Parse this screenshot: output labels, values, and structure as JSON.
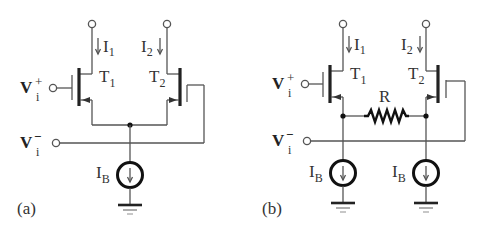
{
  "figure": {
    "panels": [
      {
        "id": "a",
        "caption": "(a)",
        "transistors": [
          {
            "name": "T",
            "sub": "1",
            "current": "I",
            "current_sub": "1"
          },
          {
            "name": "T",
            "sub": "2",
            "current": "I",
            "current_sub": "2"
          }
        ],
        "inputs": [
          {
            "label": "V",
            "sub": "i",
            "sup": "+"
          },
          {
            "label": "V",
            "sub": "i",
            "sup": "−"
          }
        ],
        "sources": [
          {
            "label": "I",
            "sub": "B"
          }
        ]
      },
      {
        "id": "b",
        "caption": "(b)",
        "transistors": [
          {
            "name": "T",
            "sub": "1",
            "current": "I",
            "current_sub": "1"
          },
          {
            "name": "T",
            "sub": "2",
            "current": "I",
            "current_sub": "2"
          }
        ],
        "inputs": [
          {
            "label": "V",
            "sub": "i",
            "sup": "+"
          },
          {
            "label": "V",
            "sub": "i",
            "sup": "−"
          }
        ],
        "resistor": {
          "label": "R"
        },
        "sources": [
          {
            "label": "I",
            "sub": "B"
          },
          {
            "label": "I",
            "sub": "B"
          }
        ]
      }
    ],
    "colors": {
      "wire": "#555555",
      "component": "#111111",
      "text": "#333333"
    }
  }
}
